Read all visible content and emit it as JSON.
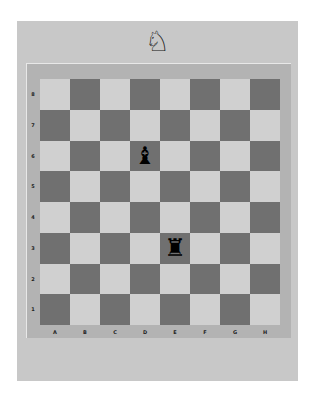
{
  "header": {
    "icon": "knight-icon",
    "glyph": "♘"
  },
  "board": {
    "ranks": [
      "8",
      "7",
      "6",
      "5",
      "4",
      "3",
      "2",
      "1"
    ],
    "files": [
      "A",
      "B",
      "C",
      "D",
      "E",
      "F",
      "G",
      "H"
    ],
    "colors": {
      "light": "#d0d0d0",
      "dark": "#707070",
      "frame": "#b3b3b3",
      "panel": "#c8c8c8"
    },
    "pieces": [
      {
        "square": "D6",
        "piece": "black-bishop",
        "glyph": "♝"
      },
      {
        "square": "E3",
        "piece": "black-rook",
        "glyph": "♜"
      }
    ]
  }
}
